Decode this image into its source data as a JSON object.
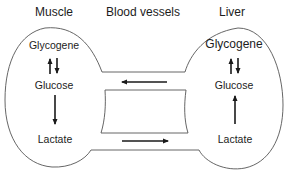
{
  "diagram": {
    "type": "cori-cycle",
    "headers": {
      "muscle": "Muscle",
      "blood_vessels": "Blood vessels",
      "liver": "Liver"
    },
    "muscle": {
      "nodes": [
        "Glycogene",
        "Glucose",
        "Lactate"
      ],
      "edges": [
        {
          "from": "Glucose",
          "to": "Glycogene",
          "style": "up"
        },
        {
          "from": "Glycogene",
          "to": "Glucose",
          "style": "down"
        },
        {
          "from": "Glucose",
          "to": "Lactate",
          "style": "down"
        }
      ]
    },
    "liver": {
      "nodes": [
        "Glycogene",
        "Glucose",
        "Lactate"
      ],
      "edges": [
        {
          "from": "Glucose",
          "to": "Glycogene",
          "style": "up"
        },
        {
          "from": "Glycogene",
          "to": "Glucose",
          "style": "down"
        },
        {
          "from": "Lactate",
          "to": "Glucose",
          "style": "up"
        }
      ]
    },
    "blood_flow": [
      {
        "from": "Liver",
        "to": "Muscle",
        "substance": "Glucose",
        "direction": "left"
      },
      {
        "from": "Muscle",
        "to": "Liver",
        "substance": "Lactate",
        "direction": "right"
      }
    ],
    "colors": {
      "outline": "#555555",
      "arrow": "#1a1a1a",
      "text": "#1c1c1c"
    }
  }
}
